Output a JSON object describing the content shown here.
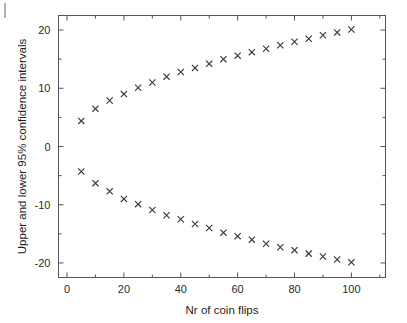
{
  "figure": {
    "artifact_name": "page-edge-scan-mark"
  },
  "chart_data": {
    "type": "scatter",
    "title": "",
    "xlabel": "Nr of coin flips",
    "ylabel": "Upper and lower 95% confidence intervals",
    "xlim": [
      -3,
      112
    ],
    "ylim": [
      -22.5,
      22.5
    ],
    "xticks": [
      0,
      20,
      40,
      60,
      80,
      100
    ],
    "xticklabels": [
      "0",
      "20",
      "40",
      "60",
      "80",
      "100"
    ],
    "yticks": [
      -20,
      -10,
      0,
      10,
      20
    ],
    "yticklabels": [
      "-20",
      "-10",
      "0",
      "10",
      "20"
    ],
    "minor_xticks": [
      10,
      30,
      50,
      70,
      90,
      110
    ],
    "grid": false,
    "legend": null,
    "marker": "x",
    "marker_color": "#3a3a3a",
    "x": [
      5,
      10,
      15,
      20,
      25,
      30,
      35,
      40,
      45,
      50,
      55,
      60,
      65,
      70,
      75,
      80,
      85,
      90,
      95,
      100
    ],
    "series": [
      {
        "name": "Upper 95% confidence interval",
        "values": [
          4.4,
          6.5,
          7.9,
          9.0,
          10.1,
          11.0,
          12.0,
          12.8,
          13.5,
          14.2,
          15.0,
          15.6,
          16.2,
          16.8,
          17.4,
          18.0,
          18.5,
          19.1,
          19.6,
          20.1
        ]
      },
      {
        "name": "Lower 95% confidence interval",
        "values": [
          -4.3,
          -6.3,
          -7.7,
          -9.0,
          -9.9,
          -10.9,
          -11.8,
          -12.5,
          -13.3,
          -14.0,
          -14.8,
          -15.4,
          -16.0,
          -16.7,
          -17.3,
          -17.8,
          -18.4,
          -18.9,
          -19.4,
          -19.9
        ]
      }
    ]
  }
}
